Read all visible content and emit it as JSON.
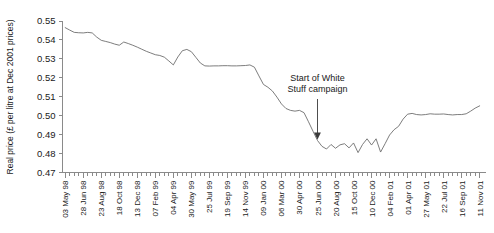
{
  "chart_data": {
    "type": "line",
    "title": "",
    "xlabel": "",
    "ylabel": "Real price (£ per litre at Dec 2001 prices)",
    "ylim": [
      0.47,
      0.55
    ],
    "ytick_labels": [
      "0.55",
      "0.54",
      "0.53",
      "0.52",
      "0.51",
      "0.50",
      "0.49",
      "0.48",
      "0.47"
    ],
    "ytick_values": [
      0.55,
      0.54,
      0.53,
      0.52,
      0.51,
      0.5,
      0.49,
      0.48,
      0.47
    ],
    "grid": false,
    "legend": "none",
    "xtick_labels": [
      "03 May 98",
      "28 Jun 98",
      "23 Aug 98",
      "18 Oct 98",
      "13 Dec 98",
      "07 Feb 99",
      "04 Apr 99",
      "30 May 99",
      "25 Jul 99",
      "19 Sep 99",
      "14 Nov 99",
      "09 Jan 00",
      "06 Mar 00",
      "30 Apr 00",
      "25 Jun 00",
      "20 Aug 00",
      "15 Oct 00",
      "10 Dec 00",
      "04 Feb 01",
      "01 Apr 01",
      "27 May 01",
      "22 Jul 01",
      "16 Sep 01",
      "11 Nov 01"
    ],
    "xtick_label_interval": 4,
    "minor_ticks_total": 93,
    "x": [
      "03 May 98",
      "17 May 98",
      "31 May 98",
      "14 Jun 98",
      "28 Jun 98",
      "12 Jul 98",
      "26 Jul 98",
      "09 Aug 98",
      "23 Aug 98",
      "06 Sep 98",
      "20 Sep 98",
      "04 Oct 98",
      "18 Oct 98",
      "01 Nov 98",
      "15 Nov 98",
      "29 Nov 98",
      "13 Dec 98",
      "27 Dec 98",
      "10 Jan 99",
      "24 Jan 99",
      "07 Feb 99",
      "21 Feb 99",
      "07 Mar 99",
      "21 Mar 99",
      "04 Apr 99",
      "18 Apr 99",
      "02 May 99",
      "16 May 99",
      "30 May 99",
      "13 Jun 99",
      "27 Jun 99",
      "11 Jul 99",
      "25 Jul 99",
      "08 Aug 99",
      "22 Aug 99",
      "05 Sep 99",
      "19 Sep 99",
      "03 Oct 99",
      "17 Oct 99",
      "31 Oct 99",
      "14 Nov 99",
      "28 Nov 99",
      "12 Dec 99",
      "26 Dec 99",
      "09 Jan 00",
      "23 Jan 00",
      "06 Feb 00",
      "20 Feb 00",
      "06 Mar 00",
      "20 Mar 00",
      "02 Apr 00",
      "16 Apr 00",
      "30 Apr 00",
      "14 May 00",
      "28 May 00",
      "11 Jun 00",
      "25 Jun 00",
      "09 Jul 00",
      "23 Jul 00",
      "06 Aug 00",
      "20 Aug 00",
      "03 Sep 00",
      "17 Sep 00",
      "01 Oct 00",
      "15 Oct 00",
      "29 Oct 00",
      "12 Nov 00",
      "26 Nov 00",
      "10 Dec 00",
      "24 Dec 00",
      "07 Jan 01",
      "21 Jan 01",
      "04 Feb 01",
      "18 Feb 01",
      "04 Mar 01",
      "18 Mar 01",
      "01 Apr 01",
      "15 Apr 01",
      "29 Apr 01",
      "13 May 01",
      "27 May 01",
      "10 Jun 01",
      "24 Jun 01",
      "08 Jul 01",
      "22 Jul 01",
      "05 Aug 01",
      "19 Aug 01",
      "02 Sep 01",
      "16 Sep 01",
      "30 Sep 01",
      "14 Oct 01",
      "28 Oct 01",
      "11 Nov 01"
    ],
    "values": [
      0.5465,
      0.5452,
      0.544,
      0.5438,
      0.5437,
      0.544,
      0.5437,
      0.5415,
      0.5398,
      0.5392,
      0.5386,
      0.5378,
      0.5372,
      0.5389,
      0.5381,
      0.5372,
      0.5362,
      0.5351,
      0.534,
      0.5331,
      0.5322,
      0.5318,
      0.5309,
      0.5289,
      0.5268,
      0.531,
      0.5343,
      0.535,
      0.5338,
      0.5308,
      0.5278,
      0.5263,
      0.5262,
      0.5263,
      0.5263,
      0.5264,
      0.5264,
      0.5263,
      0.5263,
      0.5264,
      0.5265,
      0.5268,
      0.5256,
      0.521,
      0.5165,
      0.515,
      0.513,
      0.5098,
      0.5062,
      0.5038,
      0.5028,
      0.5024,
      0.5028,
      0.5016,
      0.4968,
      0.4918,
      0.4869,
      0.4838,
      0.4824,
      0.4848,
      0.4828,
      0.4846,
      0.4852,
      0.483,
      0.4856,
      0.4805,
      0.4848,
      0.4878,
      0.4845,
      0.4878,
      0.4808,
      0.4852,
      0.4898,
      0.4926,
      0.4944,
      0.4982,
      0.5008,
      0.5012,
      0.5006,
      0.5004,
      0.5006,
      0.501,
      0.5008,
      0.5008,
      0.5009,
      0.5006,
      0.5004,
      0.5006,
      0.5006,
      0.501,
      0.5024,
      0.504,
      0.5052
    ],
    "annotations": [
      {
        "text_line1": "Start of White",
        "text_line2": "Stuff campaign",
        "points_to_x": "25 Jun 00",
        "points_to_value": 0.4869
      }
    ]
  }
}
